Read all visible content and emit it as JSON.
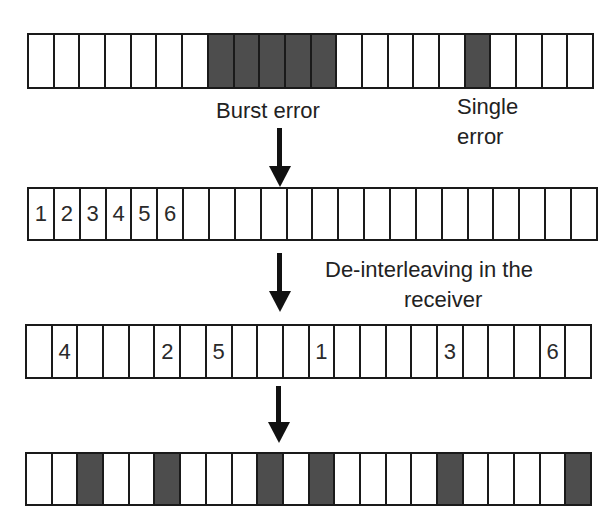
{
  "diagram": {
    "type": "interleaving-burst-error",
    "colors": {
      "error_cell": "#4d4d4d",
      "normal_cell": "#ffffff",
      "border": "#1a1a1a"
    },
    "rows": [
      {
        "id": "transmitted",
        "cells": [
          "",
          "",
          "",
          "",
          "",
          "",
          "",
          "E",
          "E",
          "E",
          "E",
          "E",
          "",
          "",
          "",
          "",
          "",
          "E",
          "",
          "",
          "",
          ""
        ],
        "labels": [
          "",
          "",
          "",
          "",
          "",
          "",
          "",
          "",
          "",
          "",
          "",
          "",
          "",
          "",
          "",
          "",
          "",
          "",
          "",
          "",
          "",
          ""
        ]
      },
      {
        "id": "received-ordered",
        "cells": [
          "",
          "",
          "",
          "",
          "",
          "",
          "",
          "",
          "",
          "",
          "",
          "",
          "",
          "",
          "",
          "",
          "",
          "",
          "",
          "",
          "",
          ""
        ],
        "labels": [
          "1",
          "2",
          "3",
          "4",
          "5",
          "6",
          "",
          "",
          "",
          "",
          "",
          "",
          "",
          "",
          "",
          "",
          "",
          "",
          "",
          "",
          "",
          ""
        ]
      },
      {
        "id": "deinterleaved-positions",
        "cells": [
          "",
          "",
          "",
          "",
          "",
          "",
          "",
          "",
          "",
          "",
          "",
          "",
          "",
          "",
          "",
          "",
          "",
          "",
          "",
          "",
          "",
          ""
        ],
        "labels": [
          "",
          "4",
          "",
          "",
          "",
          "2",
          "",
          "5",
          "",
          "",
          "",
          "1",
          "",
          "",
          "",
          "",
          "3",
          "",
          "",
          "",
          "6",
          ""
        ]
      },
      {
        "id": "scattered-errors",
        "cells": [
          "",
          "",
          "E",
          "",
          "",
          "E",
          "",
          "",
          "",
          "E",
          "",
          "E",
          "",
          "",
          "",
          "",
          "E",
          "",
          "",
          "",
          "",
          "E"
        ],
        "labels": [
          "",
          "",
          "",
          "",
          "",
          "",
          "",
          "",
          "",
          "",
          "",
          "",
          "",
          "",
          "",
          "",
          "",
          "",
          "",
          "",
          "",
          ""
        ]
      }
    ],
    "annotations": {
      "burst_error": "Burst error",
      "single_error_line1": "Single",
      "single_error_line2": "error",
      "deinterleave_line1": "De-interleaving in the",
      "deinterleave_line2": "receiver"
    },
    "arrows": [
      {
        "id": "arrow-1",
        "direction": "down"
      },
      {
        "id": "arrow-2",
        "direction": "down"
      },
      {
        "id": "arrow-3",
        "direction": "down"
      }
    ]
  }
}
